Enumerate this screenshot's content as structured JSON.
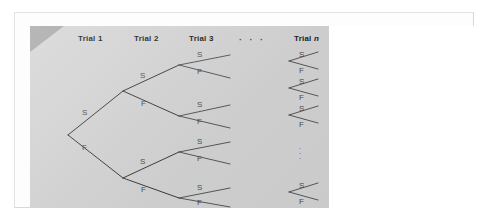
{
  "figure": {
    "type": "probability-tree-diagram",
    "panel_color": "#d5d5d5",
    "line_color": "#3c3c3c",
    "label_color": "#1b1b1b",
    "letter_color": "#4d4d4d",
    "corner_accent_color": "#a8a8a8",
    "headers": [
      {
        "text": "Trial 1",
        "italic_suffix": ""
      },
      {
        "text": "Trial 2",
        "italic_suffix": ""
      },
      {
        "text": "Trial 3",
        "italic_suffix": ""
      },
      {
        "text": "Trial ",
        "italic_suffix": "n"
      }
    ],
    "header_ellipsis": "· · ·",
    "vertical_ellipsis": ".\n.\n.",
    "outcome_labels": {
      "success": "S",
      "failure": "F"
    },
    "trial1_letters": [
      {
        "label": "S"
      },
      {
        "label": "F"
      }
    ],
    "trial2_letters": [
      {
        "label": "S"
      },
      {
        "label": "F"
      },
      {
        "label": "S"
      },
      {
        "label": "F"
      }
    ],
    "trial3_letters": [
      {
        "label": "S"
      },
      {
        "label": "F"
      },
      {
        "label": "S"
      },
      {
        "label": "F"
      },
      {
        "label": "S"
      },
      {
        "label": "F"
      },
      {
        "label": "S"
      },
      {
        "label": "F"
      }
    ],
    "trialn_letters": [
      {
        "label": "S"
      },
      {
        "label": "F"
      },
      {
        "label": "S"
      },
      {
        "label": "F"
      },
      {
        "label": "S"
      },
      {
        "label": "F"
      },
      {
        "label": "S"
      },
      {
        "label": "F"
      }
    ]
  }
}
